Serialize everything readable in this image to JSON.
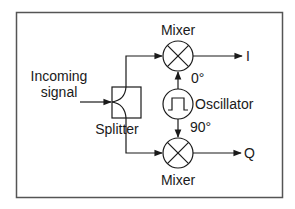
{
  "diagram": {
    "input_label_line1": "Incoming",
    "input_label_line2": "signal",
    "splitter_label": "Splitter",
    "mixer_top_label": "Mixer",
    "mixer_bottom_label": "Mixer",
    "oscillator_label": "Oscillator",
    "phase_top": "0°",
    "phase_bottom": "90°",
    "output_top": "I",
    "output_bottom": "Q",
    "colors": {
      "stroke": "#2a2a2a",
      "frame": "#555555",
      "background": "#ffffff"
    }
  }
}
